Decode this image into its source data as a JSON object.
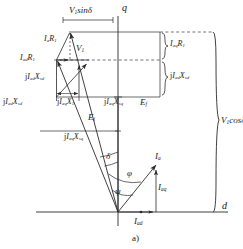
{
  "figure": {
    "caption": "a)",
    "axes": {
      "q_axis_label": "q",
      "d_axis_label": "d"
    },
    "angles": {
      "delta": "δ",
      "phi": "φ",
      "psi": "ψ"
    },
    "labels": {
      "v1_sin_delta": {
        "main": "V",
        "sub": "1",
        "trail": "sinδ"
      },
      "v1_cos_delta": {
        "main": "V",
        "sub": "1",
        "trail": "cosδ"
      },
      "ia_r1": {
        "pre": "I",
        "sub1": "a",
        "mid": "R",
        "sub2": "1"
      },
      "iad_r1": {
        "pre": "I",
        "sub1": "ad",
        "mid": "R",
        "sub2": "1"
      },
      "iaq_r1": {
        "pre": "I",
        "sub1": "aq",
        "mid": "R",
        "sub2": "1"
      },
      "v1": {
        "main": "V",
        "sub": "1"
      },
      "j_iad_xsd_left": {
        "j": "j",
        "pre": "I",
        "sub1": "ad",
        "mid": "X",
        "sub2": "sd"
      },
      "j_iad_xsd_lower": {
        "j": "j",
        "pre": "I",
        "sub1": "ad",
        "mid": "X",
        "sub2": "sd"
      },
      "j_iad_xsd_right": {
        "j": "j",
        "pre": "I",
        "sub1": "ad",
        "mid": "X",
        "sub2": "sd"
      },
      "j_iaq_x1": {
        "j": "j",
        "pre": "I",
        "sub1": "aq",
        "mid": "X",
        "sub2": "1"
      },
      "j_iaq_xsq_upper": {
        "j": "j",
        "pre": "I",
        "sub1": "aq",
        "mid": "X",
        "sub2": "sq"
      },
      "j_iaq_xsq_lower": {
        "j": "j",
        "pre": "I",
        "sub1": "aq",
        "mid": "X",
        "sub2": "sq"
      },
      "ef": {
        "main": "E",
        "sub": "f"
      },
      "ei": {
        "main": "E",
        "sub": "i"
      },
      "ia": {
        "main": "I",
        "sub": "a"
      },
      "iaq": {
        "main": "I",
        "sub": "aq"
      },
      "iad": {
        "main": "I",
        "sub": "ad"
      }
    },
    "colors": {
      "line": "#2b2b2b",
      "dashed": "#3a3a3a",
      "text": "#1a1a1a",
      "background": "#ffffff"
    }
  }
}
